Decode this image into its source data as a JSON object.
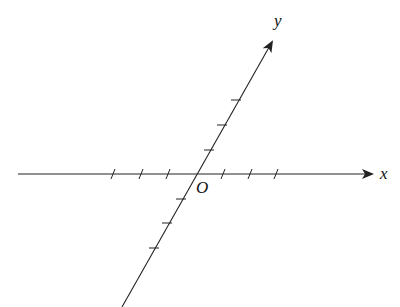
{
  "diagram": {
    "x_axis_label": "x",
    "y_axis_label": "y",
    "origin_label": "O",
    "line_color": "#222222",
    "x_ticks_left": 3,
    "x_ticks_right": 3,
    "y_ticks_up": 3,
    "y_ticks_down": 3
  }
}
